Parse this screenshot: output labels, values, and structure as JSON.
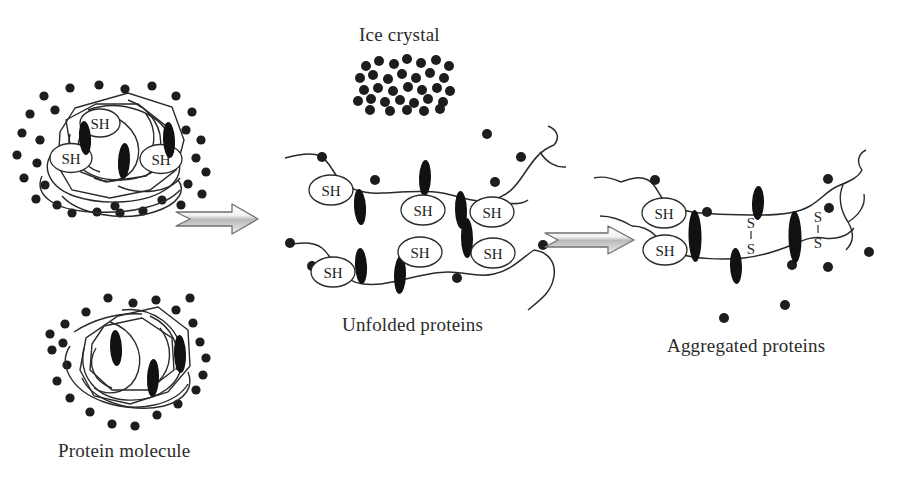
{
  "diagram": {
    "type": "process-flow",
    "background_color": "#ffffff",
    "ink_color": "#222222",
    "text_color": "#2b2b2b"
  },
  "labels": {
    "ice_crystal": "Ice crystal",
    "protein_molecule": "Protein molecule",
    "unfolded_proteins": "Unfolded proteins",
    "aggregated_proteins": "Aggregated proteins"
  },
  "chemical_groups": {
    "thiol": "SH",
    "disulfide_top": "S",
    "disulfide_bottom": "S"
  },
  "stages": [
    {
      "id": "native",
      "label": "Protein molecule",
      "description": "Two folded native protein molecules each surrounded by a ring of water/solute dots",
      "molecules": 2,
      "sh_groups_visible": 3,
      "hydrophobic_patches_visible": 6
    },
    {
      "id": "unfolded",
      "label": "Unfolded proteins",
      "description": "Two extended polypeptide chains with exposed SH groups and hydrophobic patches",
      "chains": 2,
      "sh_groups_visible": 6,
      "hydrophobic_patches_visible": 6
    },
    {
      "id": "aggregated",
      "label": "Aggregated proteins",
      "description": "Chains cross-linked by S-S disulfide bonds and hydrophobic interactions",
      "chains": 2,
      "sh_groups_visible": 2,
      "disulfide_bonds": 2,
      "hydrophobic_patches_visible": 5
    }
  ],
  "arrows": [
    {
      "id": "arrow-1",
      "from": "native",
      "to": "unfolded",
      "direction": "right"
    },
    {
      "id": "arrow-2",
      "from": "unfolded",
      "to": "aggregated",
      "direction": "right"
    }
  ],
  "ice_crystal": {
    "label": "Ice crystal",
    "dot_count": 33,
    "shape": "dense rectangular cluster"
  }
}
